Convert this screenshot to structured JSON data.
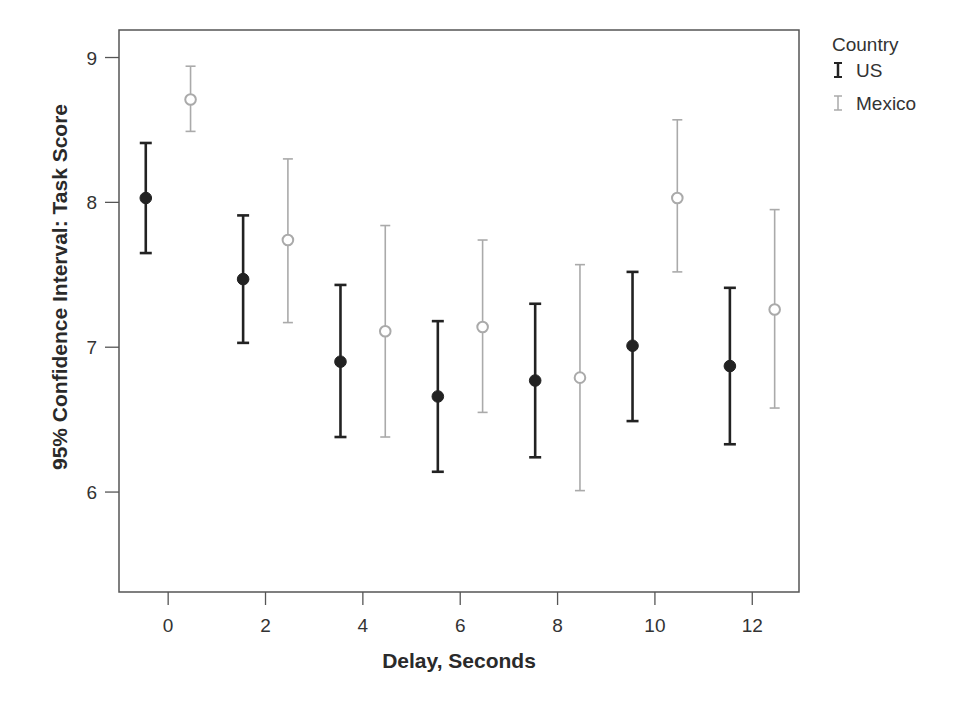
{
  "chart_data": {
    "type": "scatter",
    "subtype": "error-bar",
    "title": "",
    "xlabel": "Delay, Seconds",
    "ylabel": "95% Confidence Interval: Task Score",
    "xlim": [
      -1.01,
      12.96
    ],
    "ylim": [
      5.31,
      9.19
    ],
    "xticks": [
      0,
      2,
      4,
      6,
      8,
      10,
      12
    ],
    "yticks": [
      6,
      7,
      8,
      9
    ],
    "grid": false,
    "legend": {
      "title": "Country",
      "position": "right-top",
      "entries": [
        "US",
        "Mexico"
      ]
    },
    "dodge": 0.46,
    "categories": [
      0,
      2,
      4,
      6,
      8,
      10,
      12
    ],
    "series": [
      {
        "name": "US",
        "color": "#222222",
        "marker": "filled-circle",
        "offset": -0.46,
        "mean": [
          8.03,
          7.47,
          6.9,
          6.66,
          6.77,
          7.01,
          6.87
        ],
        "lower": [
          7.65,
          7.03,
          6.38,
          6.14,
          6.24,
          6.49,
          6.33
        ],
        "upper": [
          8.41,
          7.91,
          7.43,
          7.18,
          7.3,
          7.52,
          7.41
        ]
      },
      {
        "name": "Mexico",
        "color": "#aaaaaa",
        "marker": "open-circle",
        "offset": 0.46,
        "mean": [
          8.71,
          7.74,
          7.11,
          7.14,
          6.79,
          8.03,
          7.26
        ],
        "lower": [
          8.49,
          7.17,
          6.38,
          6.55,
          6.01,
          7.52,
          6.58
        ],
        "upper": [
          8.94,
          8.3,
          7.84,
          7.74,
          7.57,
          8.57,
          7.95
        ]
      }
    ]
  }
}
